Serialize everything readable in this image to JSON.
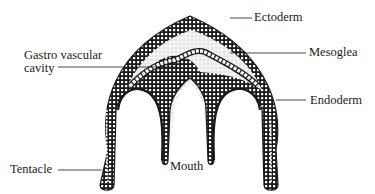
{
  "figure": {
    "labels": {
      "ectoderm": "Ectoderm",
      "mesoglea": "Mesoglea",
      "endoderm": "Endoderm",
      "gastro_line1": "Gastro vascular",
      "gastro_line2": "cavity",
      "tentacle": "Tentacle",
      "mouth": "Mouth"
    },
    "colors": {
      "ink": "#1a1a1a",
      "background": "#ffffff"
    }
  }
}
